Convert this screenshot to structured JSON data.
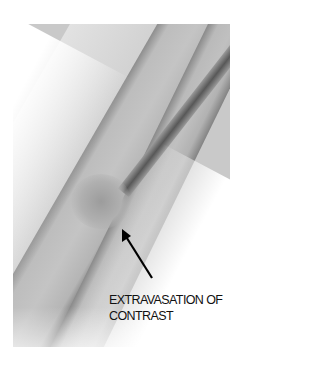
{
  "figure": {
    "type": "fluoroscopy-xray",
    "annotation": {
      "line1": "EXTRAVASATION OF",
      "line2": "CONTRAST"
    },
    "arrow": {
      "tip": [
        122,
        230
      ],
      "tail": [
        152,
        278
      ],
      "color": "#000000"
    },
    "colors": {
      "background": "#ffffff",
      "tissue": "#c9c9c9",
      "bone_edge": "#7a7a7a",
      "dark_vessel": "#555555"
    }
  }
}
